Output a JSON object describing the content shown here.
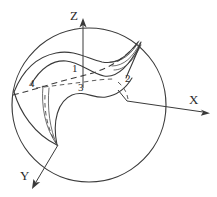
{
  "figure": {
    "background_color": "#ffffff",
    "line_color": "#3a3a3a",
    "axes": [
      {
        "name": "z-axis",
        "label": "Z",
        "label_x": 70,
        "label_y": 20,
        "direction": "up"
      },
      {
        "name": "x-axis",
        "label": "X",
        "label_x": 189,
        "label_y": 104,
        "direction": "right"
      },
      {
        "name": "y-axis",
        "label": "Y",
        "label_x": 20,
        "label_y": 180,
        "direction": "down-left"
      }
    ],
    "region_labels": [
      {
        "id": "region-1",
        "text": "1",
        "x": 72,
        "y": 72
      },
      {
        "id": "region-2",
        "text": "2",
        "x": 125,
        "y": 82
      },
      {
        "id": "region-3",
        "text": "3",
        "x": 78,
        "y": 91
      },
      {
        "id": "region-4",
        "text": "4",
        "x": 29,
        "y": 87
      }
    ],
    "sphere": {
      "name": "focal-sphere",
      "center_x": 89,
      "center_y": 105,
      "radius": 77
    }
  }
}
